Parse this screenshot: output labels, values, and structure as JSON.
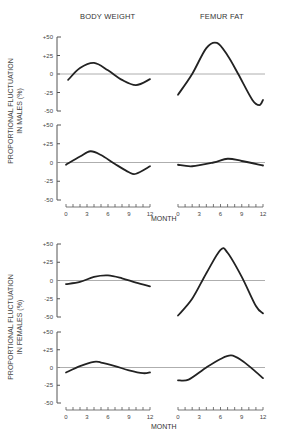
{
  "chart_data": {
    "type": "line",
    "columns": [
      "BODY WEIGHT",
      "FEMUR FAT"
    ],
    "xlabel": "MONTH",
    "x_ticks": [
      0,
      3,
      6,
      9,
      12
    ],
    "y_ticks": [
      "+50",
      "+25",
      "0",
      "-25",
      "-50"
    ],
    "ylim": [
      -50,
      50
    ],
    "xlim": [
      0,
      12
    ],
    "groups": [
      {
        "ylabel_line1": "PROPORTIONAL FLUCTUATION",
        "ylabel_line2": "IN MALES (%)",
        "panels": [
          {
            "name": "males-body-weight-upper",
            "column": "BODY WEIGHT",
            "x": [
              0.3,
              2,
              4,
              6,
              8,
              10,
              12
            ],
            "y": [
              -8,
              8,
              15,
              5,
              -8,
              -15,
              -7
            ]
          },
          {
            "name": "males-femur-fat-upper",
            "column": "FEMUR FAT",
            "x": [
              0,
              2,
              4,
              5.5,
              7,
              8.5,
              10.5,
              11.5,
              12
            ],
            "y": [
              -28,
              0,
              35,
              42,
              25,
              0,
              -35,
              -42,
              -35
            ]
          },
          {
            "name": "males-body-weight-lower",
            "column": "BODY WEIGHT",
            "x": [
              0,
              2,
              3.5,
              5,
              7,
              9,
              10,
              12
            ],
            "y": [
              -3,
              8,
              15,
              10,
              -2,
              -13,
              -15,
              -5
            ]
          },
          {
            "name": "males-femur-fat-lower",
            "column": "FEMUR FAT",
            "x": [
              0,
              2,
              5,
              7,
              9,
              12
            ],
            "y": [
              -3,
              -5,
              0,
              5,
              2,
              -4
            ]
          }
        ]
      },
      {
        "ylabel_line1": "PROPORTIONAL FLUCTUATION",
        "ylabel_line2": "IN FEMALES (%)",
        "panels": [
          {
            "name": "females-body-weight-upper",
            "column": "BODY WEIGHT",
            "x": [
              0,
              2,
              4,
              6,
              8,
              10,
              12
            ],
            "y": [
              -5,
              -2,
              5,
              7,
              3,
              -3,
              -8
            ]
          },
          {
            "name": "females-femur-fat-upper",
            "column": "FEMUR FAT",
            "x": [
              0,
              2,
              4,
              6,
              7,
              9,
              11,
              12
            ],
            "y": [
              -48,
              -25,
              10,
              42,
              38,
              5,
              -35,
              -45
            ]
          },
          {
            "name": "females-body-weight-lower",
            "column": "BODY WEIGHT",
            "x": [
              0,
              2,
              4,
              5,
              7,
              9,
              11,
              12
            ],
            "y": [
              -7,
              2,
              8,
              7,
              2,
              -4,
              -8,
              -7
            ]
          },
          {
            "name": "females-femur-fat-lower",
            "column": "FEMUR FAT",
            "x": [
              0,
              1.5,
              4,
              6,
              7.5,
              9,
              10.5,
              12
            ],
            "y": [
              -18,
              -17,
              0,
              12,
              17,
              10,
              -2,
              -15
            ]
          }
        ]
      }
    ],
    "grid": false,
    "legend": "none"
  },
  "titles": {
    "left": "BODY WEIGHT",
    "right": "FEMUR FAT"
  },
  "ylabels": {
    "males_line1": "PROPORTIONAL FLUCTUATION",
    "males_line2": "IN MALES (%)",
    "females_line1": "PROPORTIONAL FLUCTUATION",
    "females_line2": "IN FEMALES (%)"
  },
  "month_label": "MONTH"
}
